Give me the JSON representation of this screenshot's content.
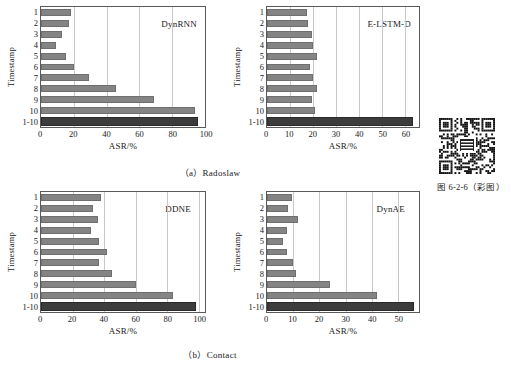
{
  "figure": {
    "caption_note": "图 6-2-6（彩图）",
    "subcaptions": {
      "top": "（a）Radoslaw",
      "bottom": "（b）Contact"
    }
  },
  "colors": {
    "bar": "#848484",
    "bar_total": "#3c3c3c",
    "grid": "#c9c9c9",
    "axis": "#5a5a5a"
  },
  "common": {
    "ylabel": "Timestamp",
    "xlabel": "ASR/%",
    "categories": [
      "1",
      "2",
      "3",
      "4",
      "5",
      "6",
      "7",
      "8",
      "9",
      "10",
      "1-10"
    ]
  },
  "chart_data": [
    {
      "id": "dynrnn",
      "type": "bar",
      "orientation": "horizontal",
      "title": "DynRNN",
      "dataset": "Radoslaw",
      "xlabel": "ASR/%",
      "ylabel": "Timestamp",
      "categories": [
        "1",
        "2",
        "3",
        "4",
        "5",
        "6",
        "7",
        "8",
        "9",
        "10",
        "1-10"
      ],
      "values": [
        18,
        17,
        13,
        9,
        15,
        20,
        29,
        46,
        69,
        94,
        96
      ],
      "xlim": [
        0,
        100
      ],
      "xticks": [
        0,
        20,
        40,
        60,
        80,
        100
      ],
      "grid": true,
      "legend": "none",
      "highlight_category": "1-10"
    },
    {
      "id": "e-lstm-d",
      "type": "bar",
      "orientation": "horizontal",
      "title": "E-LSTM-D",
      "dataset": "Radoslaw",
      "xlabel": "ASR/%",
      "ylabel": "Timestamp",
      "categories": [
        "1",
        "2",
        "3",
        "4",
        "5",
        "6",
        "7",
        "8",
        "9",
        "10",
        "1-10"
      ],
      "values": [
        17.5,
        18,
        19.5,
        20,
        21.5,
        18.5,
        20,
        21.5,
        19.5,
        21,
        63.5
      ],
      "xlim": [
        0,
        66
      ],
      "xticks": [
        0,
        10,
        20,
        30,
        40,
        50,
        60
      ],
      "grid": true,
      "legend": "none",
      "highlight_category": "1-10"
    },
    {
      "id": "ddne",
      "type": "bar",
      "orientation": "horizontal",
      "title": "DDNE",
      "dataset": "Contact",
      "xlabel": "ASR/%",
      "ylabel": "Timestamp",
      "categories": [
        "1",
        "2",
        "3",
        "4",
        "5",
        "6",
        "7",
        "8",
        "9",
        "10",
        "1-10"
      ],
      "values": [
        38,
        33,
        36,
        32,
        37,
        42,
        37,
        45,
        60,
        84,
        98
      ],
      "xlim": [
        0,
        104
      ],
      "xticks": [
        0,
        20,
        40,
        60,
        80,
        100
      ],
      "grid": true,
      "legend": "none",
      "highlight_category": "1-10"
    },
    {
      "id": "dynae",
      "type": "bar",
      "orientation": "horizontal",
      "title": "DynAE",
      "dataset": "Contact",
      "xlabel": "ASR/%",
      "ylabel": "Timestamp",
      "categories": [
        "1",
        "2",
        "3",
        "4",
        "5",
        "6",
        "7",
        "8",
        "9",
        "10",
        "1-10"
      ],
      "values": [
        9.5,
        8,
        11.8,
        7.5,
        6.2,
        7.8,
        10,
        11.2,
        24,
        42,
        56
      ],
      "xlim": [
        0,
        58
      ],
      "xticks": [
        0,
        10,
        20,
        30,
        40,
        50
      ],
      "grid": true,
      "legend": "none",
      "highlight_category": "1-10"
    }
  ]
}
